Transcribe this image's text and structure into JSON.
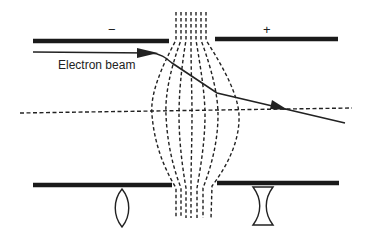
{
  "diagram": {
    "labels": {
      "beam": "Electron beam",
      "negative_electrode": "−",
      "positive_electrode": "+"
    },
    "colors": {
      "stroke": "#222222",
      "plate": "#1a1a1a",
      "background": "#ffffff"
    },
    "elements": {
      "electrodes": [
        {
          "id": "top-left",
          "polarity": "negative"
        },
        {
          "id": "top-right",
          "polarity": "positive"
        },
        {
          "id": "bottom-left",
          "polarity": "negative"
        },
        {
          "id": "bottom-right",
          "polarity": "positive"
        }
      ],
      "field_line_count": 7,
      "optical_analogs": [
        {
          "id": "converging-lens",
          "type": "convex"
        },
        {
          "id": "diverging-lens",
          "type": "concave"
        }
      ]
    }
  }
}
